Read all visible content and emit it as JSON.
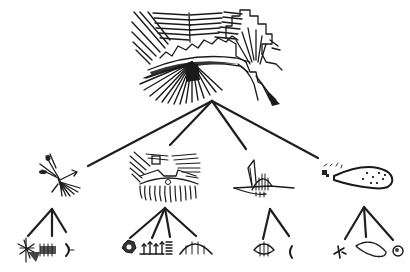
{
  "diagram": {
    "type": "hierarchy-tree",
    "ink_color": "#1a1a1a",
    "background": "#ffffff",
    "root": {
      "name": "composite-geoglyph-scene",
      "description": "Combined line-art of radiating lines, zigzag trapezoid, and branching tree-like figure"
    },
    "level1": [
      {
        "name": "tree-figure",
        "children": [
          "starburst-figure",
          "comb-insect-figure",
          "bracket-figure"
        ]
      },
      {
        "name": "radiating-trapezoid-figure",
        "children": [
          "rosette-figure",
          "plant-row-figure",
          "coil-figure",
          "dome-figure"
        ]
      },
      {
        "name": "hatched-bird-figure",
        "children": [
          "hatched-lens-figure",
          "small-hook-figure"
        ]
      },
      {
        "name": "spotted-gourd-figure",
        "children": [
          "small-glyph-figure",
          "loop-figure",
          "round-spotted-figure"
        ]
      }
    ]
  }
}
